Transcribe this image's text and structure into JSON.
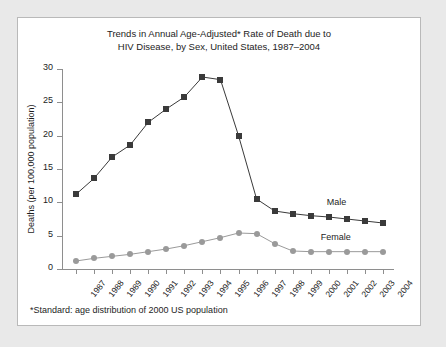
{
  "figure": {
    "title_line1": "Trends in Annual Age-Adjusted* Rate of Death due to",
    "title_line2": "HIV Disease, by Sex, United States, 1987–2004",
    "footnote": "*Standard: age distribution of 2000 US population",
    "male_label": "Male",
    "female_label": "Female",
    "colors": {
      "male": "#3a3a3a",
      "female": "#9a9a9a",
      "axis": "#8e8e8e",
      "panel": "#ffffff",
      "surround": "#e9e9e9",
      "border": "#b9b9b9",
      "text": "#1d1d1d"
    }
  },
  "chart_data": {
    "type": "line",
    "title": "Trends in Annual Age-Adjusted* Rate of Death due to HIV Disease, by Sex, United States, 1987–2004",
    "xlabel": "",
    "ylabel": "Deaths (per 100,000 population)",
    "ylim": [
      0,
      30
    ],
    "yticks": [
      0,
      5,
      10,
      15,
      20,
      25,
      30
    ],
    "grid": false,
    "legend": "inline-right",
    "categories": [
      "1987",
      "1988",
      "1989",
      "1990",
      "1991",
      "1992",
      "1993",
      "1994",
      "1995",
      "1996",
      "1997",
      "1998",
      "1999",
      "2000",
      "2001",
      "2002",
      "2003",
      "2004"
    ],
    "series": [
      {
        "name": "Male",
        "marker": "square",
        "color": "#3a3a3a",
        "values": [
          11.2,
          13.6,
          16.8,
          18.6,
          22.0,
          24.0,
          25.8,
          28.8,
          28.4,
          20.0,
          10.5,
          8.7,
          8.3,
          8.0,
          7.8,
          7.5,
          7.2,
          6.9
        ]
      },
      {
        "name": "Female",
        "marker": "circle",
        "color": "#9a9a9a",
        "values": [
          1.2,
          1.6,
          1.9,
          2.2,
          2.6,
          3.0,
          3.5,
          4.1,
          4.7,
          5.4,
          5.3,
          3.8,
          2.7,
          2.6,
          2.6,
          2.6,
          2.6,
          2.6
        ]
      }
    ]
  }
}
